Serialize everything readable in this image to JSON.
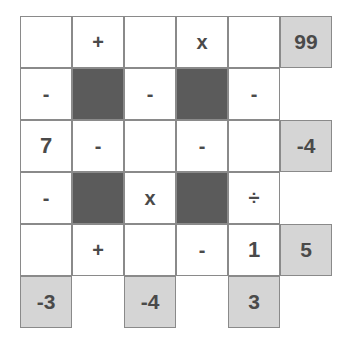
{
  "puzzle": {
    "colors": {
      "block": "#5b5b5b",
      "result": "#d5d5d5",
      "text": "#4a4a4a",
      "border": "#8a8a8a"
    },
    "cells": [
      {
        "row": 0,
        "col": 0,
        "type": "blank",
        "value": ""
      },
      {
        "row": 0,
        "col": 1,
        "type": "op",
        "value": "+"
      },
      {
        "row": 0,
        "col": 2,
        "type": "blank",
        "value": ""
      },
      {
        "row": 0,
        "col": 3,
        "type": "op",
        "value": "x"
      },
      {
        "row": 0,
        "col": 4,
        "type": "blank",
        "value": ""
      },
      {
        "row": 0,
        "col": 5,
        "type": "result",
        "value": "99"
      },
      {
        "row": 1,
        "col": 0,
        "type": "op",
        "value": "-"
      },
      {
        "row": 1,
        "col": 1,
        "type": "block",
        "value": ""
      },
      {
        "row": 1,
        "col": 2,
        "type": "op",
        "value": "-"
      },
      {
        "row": 1,
        "col": 3,
        "type": "block",
        "value": ""
      },
      {
        "row": 1,
        "col": 4,
        "type": "op",
        "value": "-"
      },
      {
        "row": 2,
        "col": 0,
        "type": "num",
        "value": "7"
      },
      {
        "row": 2,
        "col": 1,
        "type": "op",
        "value": "-"
      },
      {
        "row": 2,
        "col": 2,
        "type": "blank",
        "value": ""
      },
      {
        "row": 2,
        "col": 3,
        "type": "op",
        "value": "-"
      },
      {
        "row": 2,
        "col": 4,
        "type": "blank",
        "value": ""
      },
      {
        "row": 2,
        "col": 5,
        "type": "result",
        "value": "-4"
      },
      {
        "row": 3,
        "col": 0,
        "type": "op",
        "value": "-"
      },
      {
        "row": 3,
        "col": 1,
        "type": "block",
        "value": ""
      },
      {
        "row": 3,
        "col": 2,
        "type": "op",
        "value": "x"
      },
      {
        "row": 3,
        "col": 3,
        "type": "block",
        "value": ""
      },
      {
        "row": 3,
        "col": 4,
        "type": "op",
        "value": "÷"
      },
      {
        "row": 4,
        "col": 0,
        "type": "blank",
        "value": ""
      },
      {
        "row": 4,
        "col": 1,
        "type": "op",
        "value": "+"
      },
      {
        "row": 4,
        "col": 2,
        "type": "blank",
        "value": ""
      },
      {
        "row": 4,
        "col": 3,
        "type": "op",
        "value": "-"
      },
      {
        "row": 4,
        "col": 4,
        "type": "num",
        "value": "1"
      },
      {
        "row": 4,
        "col": 5,
        "type": "result",
        "value": "5"
      },
      {
        "row": 5,
        "col": 0,
        "type": "result",
        "value": "-3"
      },
      {
        "row": 5,
        "col": 2,
        "type": "result",
        "value": "-4"
      },
      {
        "row": 5,
        "col": 4,
        "type": "result",
        "value": "3"
      }
    ]
  }
}
